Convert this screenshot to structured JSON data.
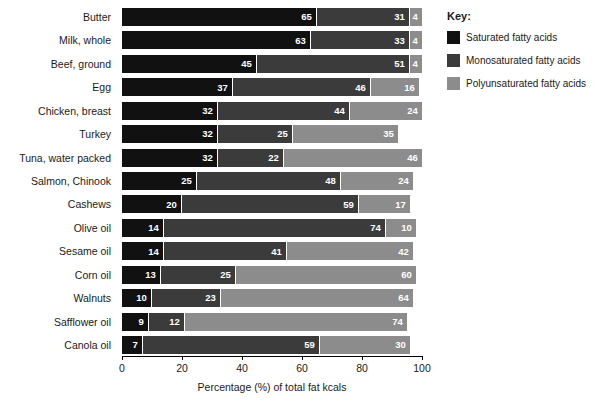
{
  "chart_data": {
    "type": "bar",
    "subtype": "stacked-horizontal-bar",
    "title": "",
    "xlabel": "Percentage (%) of total fat kcals",
    "ylabel": "",
    "xlim": [
      0,
      100
    ],
    "xticks": [
      0,
      20,
      40,
      60,
      80,
      100
    ],
    "xtick_labels": [
      "0",
      "20",
      "40",
      "60",
      "80",
      "100"
    ],
    "grid": false,
    "legend_position": "right",
    "legend_title": "Key:",
    "categories": [
      "Butter",
      "Milk, whole",
      "Beef, ground",
      "Egg",
      "Chicken, breast",
      "Turkey",
      "Tuna, water packed",
      "Salmon, Chinook",
      "Cashews",
      "Olive oil",
      "Sesame oil",
      "Corn oil",
      "Walnuts",
      "Safflower oil",
      "Canola oil"
    ],
    "series": [
      {
        "name": "Saturated fatty acids",
        "color": "#111111",
        "values": [
          65,
          63,
          45,
          37,
          32,
          32,
          32,
          25,
          20,
          14,
          14,
          13,
          10,
          9,
          7
        ]
      },
      {
        "name": "Monosaturated fatty acids",
        "color": "#3b3b3b",
        "values": [
          31,
          33,
          51,
          46,
          44,
          25,
          22,
          48,
          59,
          74,
          41,
          25,
          23,
          12,
          59
        ]
      },
      {
        "name": "Polyunsaturated fatty acids",
        "color": "#8c8c8c",
        "values": [
          4,
          4,
          4,
          16,
          24,
          35,
          46,
          24,
          17,
          10,
          42,
          60,
          64,
          74,
          30
        ]
      }
    ]
  },
  "legend": {
    "title": "Key:",
    "items": [
      {
        "label": "Saturated fatty acids",
        "color": "#111111"
      },
      {
        "label": "Monosaturated fatty acids",
        "color": "#3b3b3b"
      },
      {
        "label": "Polyunsaturated fatty acids",
        "color": "#8c8c8c"
      }
    ]
  },
  "axis": {
    "x_title": "Percentage (%) of total fat kcals",
    "x_tick_labels": [
      "0",
      "20",
      "40",
      "60",
      "80",
      "100"
    ]
  }
}
